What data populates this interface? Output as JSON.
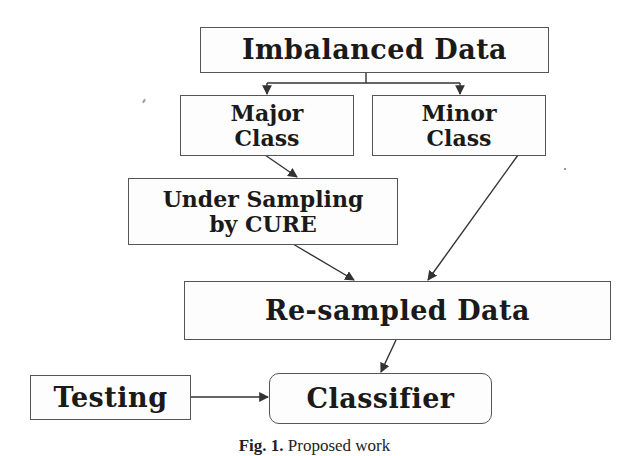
{
  "diagram": {
    "nodes": [
      {
        "id": "imbalanced",
        "label": "Imbalanced Data"
      },
      {
        "id": "major",
        "line1": "Major",
        "line2": "Class"
      },
      {
        "id": "minor",
        "line1": "Minor",
        "line2": "Class"
      },
      {
        "id": "undersampling",
        "line1": "Under Sampling",
        "line2": "by CURE"
      },
      {
        "id": "resampled",
        "label": "Re-sampled Data"
      },
      {
        "id": "testing",
        "label": "Testing"
      },
      {
        "id": "classifier",
        "label": "Classifier"
      }
    ],
    "edges": [
      {
        "from": "imbalanced",
        "to": "major"
      },
      {
        "from": "imbalanced",
        "to": "minor"
      },
      {
        "from": "major",
        "to": "undersampling"
      },
      {
        "from": "undersampling",
        "to": "resampled"
      },
      {
        "from": "minor",
        "to": "resampled"
      },
      {
        "from": "resampled",
        "to": "classifier"
      },
      {
        "from": "testing",
        "to": "classifier"
      }
    ],
    "caption": {
      "prefix": "Fig. 1.",
      "text": "Proposed work"
    },
    "colors": {
      "stroke": "#333333",
      "box_border": "#555555",
      "text": "#1a1a1a",
      "background": "#ffffff"
    }
  }
}
